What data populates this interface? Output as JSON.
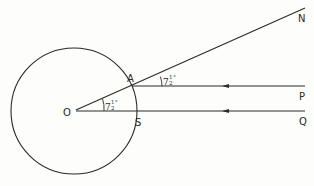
{
  "diagram": {
    "type": "geometry",
    "points": {
      "O": {
        "label": "O",
        "x": 74,
        "y": 111
      },
      "A": {
        "label": "A",
        "x": 132,
        "y": 86
      },
      "S": {
        "label": "S",
        "x": 137,
        "y": 111
      },
      "N": {
        "label": "N",
        "x": 305,
        "y": 8
      },
      "P": {
        "label": "P",
        "x": 305,
        "y": 86
      },
      "Q": {
        "label": "Q",
        "x": 305,
        "y": 111
      }
    },
    "circle": {
      "center": "O",
      "radius": 63
    },
    "angles": [
      {
        "at": "O",
        "between": [
          "S",
          "A"
        ],
        "whole": "7",
        "fraction_num": "1",
        "fraction_den": "2",
        "degree": "°"
      },
      {
        "at": "A",
        "between": [
          "P",
          "N"
        ],
        "whole": "7",
        "fraction_num": "1",
        "fraction_den": "2",
        "degree": "°"
      }
    ],
    "lines": [
      {
        "from": "O",
        "to": "N"
      },
      {
        "from": "A",
        "to": "P",
        "arrow": "toward A"
      },
      {
        "from": "O",
        "to": "Q",
        "arrow": "toward O"
      }
    ],
    "stroke_color": "#2a2a2a"
  }
}
